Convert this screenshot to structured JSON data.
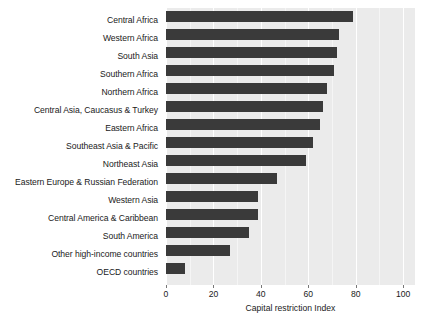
{
  "chart_data": {
    "type": "bar",
    "orientation": "horizontal",
    "title": "",
    "xlabel": "Capital restriction Index",
    "ylabel": "",
    "xlim": [
      0,
      105
    ],
    "xticks": [
      0,
      20,
      40,
      60,
      80,
      100
    ],
    "xtick_labels": [
      "0",
      "20",
      "40",
      "60",
      "80",
      "100"
    ],
    "grid": true,
    "grid_axis": "x",
    "legend": null,
    "categories": [
      "Central Africa",
      "Western Africa",
      "South Asia",
      "Southern Africa",
      "Northern Africa",
      "Central Asia, Caucasus & Turkey",
      "Eastern Africa",
      "Southeast Asia & Pacific",
      "Northeast Asia",
      "Eastern Europe & Russian Federation",
      "Western Asia",
      "Central America & Caribbean",
      "South America",
      "Other high-income countries",
      "OECD countries"
    ],
    "values": [
      79,
      73,
      72,
      71,
      68,
      66,
      65,
      62,
      59,
      47,
      39,
      39,
      35,
      27,
      8
    ],
    "bar_color": "#3a3a3a",
    "panel_background": "#ebebeb",
    "gridline_color": "#ffffff"
  }
}
